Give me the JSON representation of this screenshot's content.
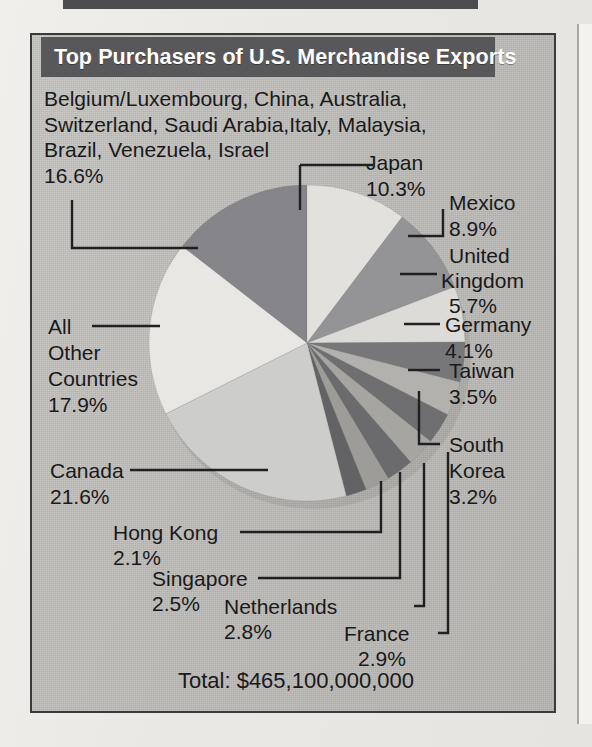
{
  "figure": {
    "title": "Top Purchasers of U.S. Merchandise Exports",
    "total_label": "Total: $465,100,000,000"
  },
  "labels": {
    "other_named_countries": "Belgium/Luxembourg, China, Australia,\nSwitzerland, Saudi Arabia,Italy, Malaysia,\nBrazil, Venezuela, Israel",
    "other_named_countries_pct": "16.6%",
    "japan": "Japan",
    "japan_pct": "10.3%",
    "mexico": "Mexico",
    "mexico_pct": "8.9%",
    "uk_line1": "United",
    "uk_line2": "Kingdom",
    "uk_pct": "5.7%",
    "germany": "Germany",
    "germany_pct": "4.1%",
    "taiwan": "Taiwan",
    "taiwan_pct": "3.5%",
    "south_korea_line1": "South",
    "south_korea_line2": "Korea",
    "south_korea_pct": "3.2%",
    "france": "France",
    "france_pct": "2.9%",
    "netherlands": "Netherlands",
    "netherlands_pct": "2.8%",
    "singapore": "Singapore",
    "singapore_pct": "2.5%",
    "hong_kong": "Hong Kong",
    "hong_kong_pct": "2.1%",
    "canada": "Canada",
    "canada_pct": "21.6%",
    "all_other_line1": "All",
    "all_other_line2": "Other",
    "all_other_line3": "Countries",
    "all_other_pct": "17.9%"
  },
  "colors": {
    "title_band": "#58585a",
    "frame_border": "#3a3a3c",
    "panel_bg": "#bdbcb8",
    "leader_line": "#202022",
    "text": "#19191b"
  },
  "chart_data": {
    "type": "pie",
    "title": "Top Purchasers of U.S. Merchandise Exports",
    "total": "$465,100,000,000",
    "value_unit": "percent of U.S. merchandise exports",
    "legend": "labels with leader lines",
    "categories": [
      "Canada",
      "Japan",
      "Mexico",
      "United Kingdom",
      "Germany",
      "Taiwan",
      "South Korea",
      "France",
      "Netherlands",
      "Singapore",
      "Hong Kong",
      "All Other Countries",
      "Belgium/Luxembourg, China, Australia, Switzerland, Saudi Arabia, Italy, Malaysia, Brazil, Venezuela, Israel"
    ],
    "values": [
      21.6,
      10.3,
      8.9,
      5.7,
      4.1,
      3.5,
      3.2,
      2.9,
      2.8,
      2.5,
      2.1,
      17.9,
      16.6
    ],
    "slice_colors": [
      "#cdcdcb",
      "#e2e1dd",
      "#949496",
      "#dcdbd7",
      "#77777a",
      "#b2b1ae",
      "#6f6f72",
      "#a6a5a2",
      "#6b6b6e",
      "#9d9c99",
      "#636366",
      "#e8e7e3",
      "#86868a"
    ]
  }
}
